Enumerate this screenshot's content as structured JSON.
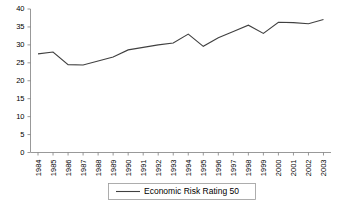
{
  "chart_data": {
    "type": "line",
    "title": "",
    "xlabel": "",
    "ylabel": "",
    "ylim": [
      0,
      40
    ],
    "ytick_values": [
      0,
      5,
      10,
      15,
      20,
      25,
      30,
      35,
      40
    ],
    "ytick_labels": [
      "0",
      "5",
      "10",
      "15",
      "20",
      "25",
      "30",
      "35",
      "40"
    ],
    "grid": false,
    "legend_position": "bottom-center",
    "categories": [
      "1984",
      "1985",
      "1986",
      "1987",
      "1988",
      "1989",
      "1990",
      "1991",
      "1992",
      "1993",
      "1994",
      "1995",
      "1996",
      "1997",
      "1998",
      "1999",
      "2000",
      "2001",
      "2002",
      "2003"
    ],
    "series": [
      {
        "name": "Economic Risk Rating 50",
        "color": "#404040",
        "values": [
          27.5,
          28.0,
          24.5,
          24.4,
          25.5,
          26.6,
          28.6,
          29.3,
          30.0,
          30.5,
          33.0,
          29.6,
          32.0,
          33.7,
          35.5,
          33.2,
          36.3,
          36.2,
          35.9,
          37.1
        ]
      }
    ],
    "legend_entries": [
      "Economic Risk Rating 50"
    ]
  },
  "colors": {
    "line": "#404040",
    "axis": "#7f7f7f",
    "text": "#000000",
    "background": "#ffffff",
    "legend_border": "#9a9a9a"
  }
}
